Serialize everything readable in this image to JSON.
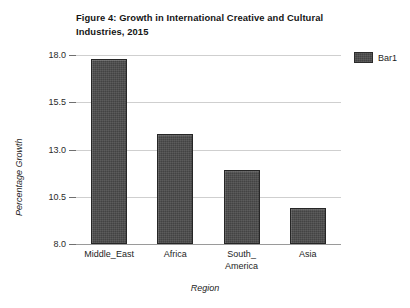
{
  "chart_data": {
    "type": "bar",
    "title": "Figure 4: Growth in International Creative and Cultural Industries, 2015",
    "categories": [
      "Middle_East",
      "Africa",
      "South_\nAmerica",
      "Asia"
    ],
    "values": [
      17.8,
      13.8,
      11.9,
      9.9
    ],
    "series": [
      {
        "name": "Bar1",
        "values": [
          17.8,
          13.8,
          11.9,
          9.9
        ]
      }
    ],
    "xlabel": "Region",
    "ylabel": "Percentage Growth",
    "ylim": [
      8.0,
      18.0
    ],
    "yticks": [
      "8.0",
      "10.5",
      "13.0",
      "15.5",
      "18.0"
    ],
    "ytick_values": [
      8.0,
      10.5,
      13.0,
      15.5,
      18.0
    ],
    "grid": true,
    "legend_position": "top-right",
    "legend_entries": [
      "Bar1"
    ],
    "colors": {
      "bar_fill": "#4a4a4a",
      "bar_border": "#262626",
      "gridline": "#cfcfcf",
      "axis": "#9a9a9a",
      "background": "#ffffff",
      "text": "#1d1d1d"
    }
  }
}
